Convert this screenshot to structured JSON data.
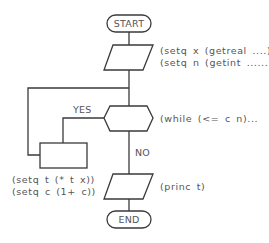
{
  "diagram": {
    "type": "flowchart",
    "nodes": {
      "start": {
        "shape": "terminal",
        "label": "START"
      },
      "input": {
        "shape": "parallelogram",
        "lines": [
          "(setq x (getreal ....)",
          "(setq n (getint ......)"
        ]
      },
      "loop_decision": {
        "shape": "hexagon",
        "label": "(while (<= c n)..."
      },
      "process": {
        "shape": "rectangle",
        "lines": [
          "(setq t (* t x))",
          "(setq c (1+ c))"
        ]
      },
      "output": {
        "shape": "parallelogram",
        "label": "(princ t)"
      },
      "end": {
        "shape": "terminal",
        "label": "END"
      }
    },
    "edges": {
      "yes_label": "YES",
      "no_label": "NO"
    },
    "colors": {
      "stroke": "#3a3a3a",
      "text": "#555555",
      "background": "#ffffff"
    }
  }
}
